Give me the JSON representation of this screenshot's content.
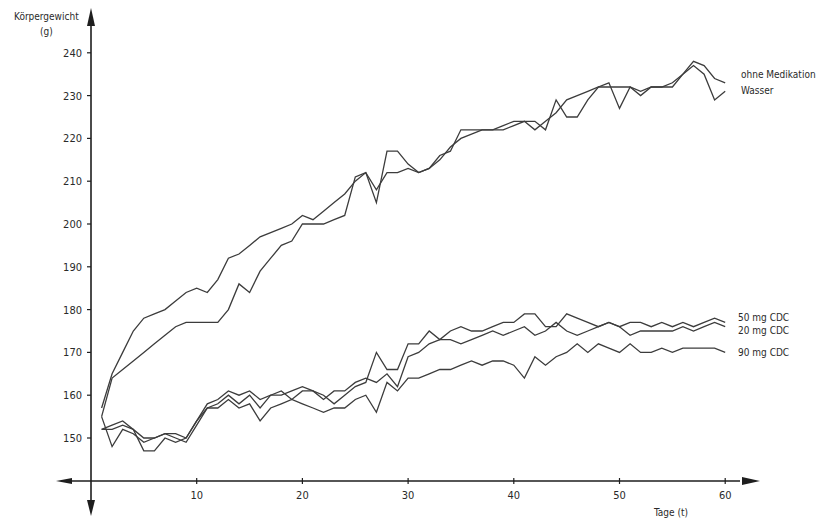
{
  "chart_data": {
    "type": "line",
    "title": "",
    "ylabel": "Körpergewicht",
    "ylabel_unit": "(g)",
    "xlabel": "Tage (t)",
    "xlim": [
      0,
      62
    ],
    "ylim": [
      141,
      246
    ],
    "xticks": [
      10,
      20,
      30,
      40,
      50,
      60
    ],
    "yticks": [
      150,
      160,
      170,
      180,
      190,
      200,
      210,
      220,
      230,
      240
    ],
    "grid": false,
    "legend_position": "right, inline labels at line ends",
    "series": [
      {
        "name": "ohne Medikation",
        "points": [
          [
            1,
            157
          ],
          [
            2,
            165
          ],
          [
            3,
            170
          ],
          [
            4,
            175
          ],
          [
            5,
            178
          ],
          [
            6,
            179
          ],
          [
            7,
            180
          ],
          [
            8,
            182
          ],
          [
            9,
            184
          ],
          [
            10,
            185
          ],
          [
            11,
            184
          ],
          [
            12,
            187
          ],
          [
            13,
            192
          ],
          [
            14,
            193
          ],
          [
            15,
            195
          ],
          [
            16,
            197
          ],
          [
            17,
            198
          ],
          [
            18,
            199
          ],
          [
            19,
            200
          ],
          [
            20,
            202
          ],
          [
            21,
            201
          ],
          [
            22,
            203
          ],
          [
            23,
            205
          ],
          [
            24,
            207
          ],
          [
            25,
            210
          ],
          [
            26,
            212
          ],
          [
            27,
            208
          ],
          [
            28,
            212
          ],
          [
            29,
            212
          ],
          [
            30,
            213
          ],
          [
            31,
            212
          ],
          [
            32,
            213
          ],
          [
            33,
            215
          ],
          [
            34,
            218
          ],
          [
            35,
            220
          ],
          [
            36,
            221
          ],
          [
            37,
            222
          ],
          [
            38,
            222
          ],
          [
            39,
            222
          ],
          [
            40,
            223
          ],
          [
            41,
            224
          ],
          [
            42,
            222
          ],
          [
            43,
            224
          ],
          [
            44,
            226
          ],
          [
            45,
            229
          ],
          [
            46,
            230
          ],
          [
            47,
            231
          ],
          [
            48,
            232
          ],
          [
            49,
            232
          ],
          [
            50,
            232
          ],
          [
            51,
            232
          ],
          [
            52,
            231
          ],
          [
            53,
            232
          ],
          [
            54,
            232
          ],
          [
            55,
            232
          ],
          [
            56,
            235
          ],
          [
            57,
            238
          ],
          [
            58,
            237
          ],
          [
            59,
            234
          ],
          [
            60,
            233
          ]
        ]
      },
      {
        "name": "Wasser",
        "points": [
          [
            1,
            155
          ],
          [
            2,
            164
          ],
          [
            3,
            166
          ],
          [
            4,
            168
          ],
          [
            5,
            170
          ],
          [
            6,
            172
          ],
          [
            7,
            174
          ],
          [
            8,
            176
          ],
          [
            9,
            177
          ],
          [
            10,
            177
          ],
          [
            11,
            177
          ],
          [
            12,
            177
          ],
          [
            13,
            180
          ],
          [
            14,
            186
          ],
          [
            15,
            184
          ],
          [
            16,
            189
          ],
          [
            17,
            192
          ],
          [
            18,
            195
          ],
          [
            19,
            196
          ],
          [
            20,
            200
          ],
          [
            21,
            200
          ],
          [
            22,
            200
          ],
          [
            23,
            201
          ],
          [
            24,
            202
          ],
          [
            25,
            211
          ],
          [
            26,
            212
          ],
          [
            27,
            205
          ],
          [
            28,
            217
          ],
          [
            29,
            217
          ],
          [
            30,
            214
          ],
          [
            31,
            212
          ],
          [
            32,
            213
          ],
          [
            33,
            216
          ],
          [
            34,
            217
          ],
          [
            35,
            222
          ],
          [
            36,
            222
          ],
          [
            37,
            222
          ],
          [
            38,
            222
          ],
          [
            39,
            223
          ],
          [
            40,
            224
          ],
          [
            41,
            224
          ],
          [
            42,
            224
          ],
          [
            43,
            222
          ],
          [
            44,
            229
          ],
          [
            45,
            225
          ],
          [
            46,
            225
          ],
          [
            47,
            229
          ],
          [
            48,
            232
          ],
          [
            49,
            233
          ],
          [
            50,
            227
          ],
          [
            51,
            232
          ],
          [
            52,
            230
          ],
          [
            53,
            232
          ],
          [
            54,
            232
          ],
          [
            55,
            233
          ],
          [
            56,
            235
          ],
          [
            57,
            237
          ],
          [
            58,
            235
          ],
          [
            59,
            229
          ],
          [
            60,
            231
          ]
        ]
      },
      {
        "name": "50 mg CDC",
        "points": [
          [
            1,
            155
          ],
          [
            2,
            148
          ],
          [
            3,
            152
          ],
          [
            4,
            151
          ],
          [
            5,
            149
          ],
          [
            6,
            150
          ],
          [
            7,
            151
          ],
          [
            8,
            150
          ],
          [
            9,
            149
          ],
          [
            10,
            153
          ],
          [
            11,
            157
          ],
          [
            12,
            158
          ],
          [
            13,
            160
          ],
          [
            14,
            158
          ],
          [
            15,
            160
          ],
          [
            16,
            157
          ],
          [
            17,
            160
          ],
          [
            18,
            161
          ],
          [
            19,
            159
          ],
          [
            20,
            161
          ],
          [
            21,
            161
          ],
          [
            22,
            160
          ],
          [
            23,
            158
          ],
          [
            24,
            160
          ],
          [
            25,
            162
          ],
          [
            26,
            163
          ],
          [
            27,
            170
          ],
          [
            28,
            166
          ],
          [
            29,
            166
          ],
          [
            30,
            172
          ],
          [
            31,
            172
          ],
          [
            32,
            175
          ],
          [
            33,
            173
          ],
          [
            34,
            175
          ],
          [
            35,
            176
          ],
          [
            36,
            175
          ],
          [
            37,
            175
          ],
          [
            38,
            176
          ],
          [
            39,
            177
          ],
          [
            40,
            177
          ],
          [
            41,
            179
          ],
          [
            42,
            179
          ],
          [
            43,
            176
          ],
          [
            44,
            176
          ],
          [
            45,
            179
          ],
          [
            46,
            178
          ],
          [
            47,
            177
          ],
          [
            48,
            176
          ],
          [
            49,
            177
          ],
          [
            50,
            176
          ],
          [
            51,
            177
          ],
          [
            52,
            177
          ],
          [
            53,
            176
          ],
          [
            54,
            177
          ],
          [
            55,
            176
          ],
          [
            56,
            177
          ],
          [
            57,
            176
          ],
          [
            58,
            177
          ],
          [
            59,
            178
          ],
          [
            60,
            177
          ]
        ]
      },
      {
        "name": "20 mg CDC",
        "points": [
          [
            1,
            152
          ],
          [
            2,
            152
          ],
          [
            3,
            153
          ],
          [
            4,
            152
          ],
          [
            5,
            150
          ],
          [
            6,
            150
          ],
          [
            7,
            151
          ],
          [
            8,
            151
          ],
          [
            9,
            150
          ],
          [
            10,
            154
          ],
          [
            11,
            158
          ],
          [
            12,
            159
          ],
          [
            13,
            161
          ],
          [
            14,
            160
          ],
          [
            15,
            161
          ],
          [
            16,
            159
          ],
          [
            17,
            160
          ],
          [
            18,
            160
          ],
          [
            19,
            161
          ],
          [
            20,
            162
          ],
          [
            21,
            161
          ],
          [
            22,
            159
          ],
          [
            23,
            161
          ],
          [
            24,
            161
          ],
          [
            25,
            163
          ],
          [
            26,
            164
          ],
          [
            27,
            163
          ],
          [
            28,
            165
          ],
          [
            29,
            162
          ],
          [
            30,
            169
          ],
          [
            31,
            170
          ],
          [
            32,
            172
          ],
          [
            33,
            173
          ],
          [
            34,
            173
          ],
          [
            35,
            172
          ],
          [
            36,
            173
          ],
          [
            37,
            174
          ],
          [
            38,
            175
          ],
          [
            39,
            174
          ],
          [
            40,
            175
          ],
          [
            41,
            176
          ],
          [
            42,
            174
          ],
          [
            43,
            175
          ],
          [
            44,
            177
          ],
          [
            45,
            175
          ],
          [
            46,
            174
          ],
          [
            47,
            175
          ],
          [
            48,
            176
          ],
          [
            49,
            177
          ],
          [
            50,
            176
          ],
          [
            51,
            174
          ],
          [
            52,
            175
          ],
          [
            53,
            175
          ],
          [
            54,
            175
          ],
          [
            55,
            175
          ],
          [
            56,
            176
          ],
          [
            57,
            175
          ],
          [
            58,
            176
          ],
          [
            59,
            177
          ],
          [
            60,
            176
          ]
        ]
      },
      {
        "name": "90 mg CDC",
        "points": [
          [
            1,
            152
          ],
          [
            2,
            153
          ],
          [
            3,
            154
          ],
          [
            4,
            152
          ],
          [
            5,
            147
          ],
          [
            6,
            147
          ],
          [
            7,
            150
          ],
          [
            8,
            149
          ],
          [
            9,
            150
          ],
          [
            10,
            154
          ],
          [
            11,
            157
          ],
          [
            12,
            157
          ],
          [
            13,
            159
          ],
          [
            14,
            157
          ],
          [
            15,
            158
          ],
          [
            16,
            154
          ],
          [
            17,
            157
          ],
          [
            18,
            158
          ],
          [
            19,
            159
          ],
          [
            20,
            158
          ],
          [
            21,
            157
          ],
          [
            22,
            156
          ],
          [
            23,
            157
          ],
          [
            24,
            157
          ],
          [
            25,
            159
          ],
          [
            26,
            160
          ],
          [
            27,
            156
          ],
          [
            28,
            163
          ],
          [
            29,
            161
          ],
          [
            30,
            164
          ],
          [
            31,
            164
          ],
          [
            32,
            165
          ],
          [
            33,
            166
          ],
          [
            34,
            166
          ],
          [
            35,
            167
          ],
          [
            36,
            168
          ],
          [
            37,
            167
          ],
          [
            38,
            168
          ],
          [
            39,
            168
          ],
          [
            40,
            167
          ],
          [
            41,
            164
          ],
          [
            42,
            169
          ],
          [
            43,
            167
          ],
          [
            44,
            169
          ],
          [
            45,
            170
          ],
          [
            46,
            172
          ],
          [
            47,
            170
          ],
          [
            48,
            172
          ],
          [
            49,
            171
          ],
          [
            50,
            170
          ],
          [
            51,
            172
          ],
          [
            52,
            170
          ],
          [
            53,
            170
          ],
          [
            54,
            171
          ],
          [
            55,
            170
          ],
          [
            56,
            171
          ],
          [
            57,
            171
          ],
          [
            58,
            171
          ],
          [
            59,
            171
          ],
          [
            60,
            170
          ]
        ]
      }
    ],
    "legend": [
      "ohne Medikation",
      "Wasser",
      "50 mg CDC",
      "20 mg CDC",
      "90 mg CDC"
    ]
  },
  "axes": {
    "y_title": "Körpergewicht",
    "y_unit": "(g)",
    "x_title": "Tage (t)",
    "y_tick_labels": [
      "150",
      "160",
      "170",
      "180",
      "190",
      "200",
      "210",
      "220",
      "230",
      "240"
    ],
    "x_tick_labels": [
      "10",
      "20",
      "30",
      "40",
      "50",
      "60"
    ]
  },
  "legend_labels": {
    "ohne": "ohne Medikation",
    "wasser": "Wasser",
    "cdc50": "50 mg CDC",
    "cdc20": "20 mg CDC",
    "cdc90": "90 mg CDC"
  },
  "colors": {
    "line": "#3c3c3c",
    "axis": "#1e1e1e",
    "text": "#2a2a2a",
    "background": "#ffffff"
  }
}
